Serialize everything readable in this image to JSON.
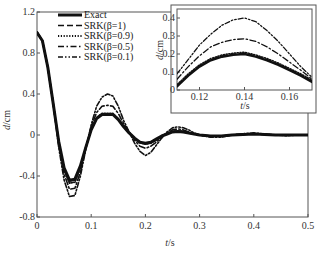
{
  "chart_data": [
    {
      "type": "line",
      "title": "",
      "xlabel": "t/s",
      "ylabel": "d/cm",
      "xlim": [
        0,
        0.5
      ],
      "ylim": [
        -0.8,
        1.2
      ],
      "xticks": [
        0,
        0.1,
        0.2,
        0.3,
        0.4,
        0.5
      ],
      "xtick_labels": [
        "0",
        "0.1",
        "0.2",
        "0.3",
        "0.4",
        "0.5"
      ],
      "yticks": [
        -0.8,
        -0.4,
        0,
        0.4,
        0.8,
        1.2
      ],
      "ytick_labels": [
        "-0.8",
        "-0.4",
        "0",
        "0.4",
        "0.8",
        "1.2"
      ],
      "grid": false,
      "legend_position": "upper left",
      "x": [
        0,
        0.01,
        0.02,
        0.03,
        0.04,
        0.05,
        0.06,
        0.07,
        0.08,
        0.09,
        0.1,
        0.11,
        0.12,
        0.13,
        0.14,
        0.15,
        0.16,
        0.17,
        0.18,
        0.19,
        0.2,
        0.21,
        0.22,
        0.23,
        0.24,
        0.25,
        0.26,
        0.27,
        0.28,
        0.29,
        0.3,
        0.32,
        0.34,
        0.36,
        0.38,
        0.4,
        0.42,
        0.44,
        0.46,
        0.48,
        0.5
      ],
      "series": [
        {
          "name": "Exact",
          "style": "solid-thick",
          "values": [
            1.0,
            0.92,
            0.66,
            0.3,
            -0.06,
            -0.32,
            -0.44,
            -0.43,
            -0.3,
            -0.12,
            0.05,
            0.16,
            0.2,
            0.2,
            0.2,
            0.15,
            0.08,
            0.02,
            -0.03,
            -0.07,
            -0.08,
            -0.07,
            -0.04,
            -0.01,
            0.01,
            0.03,
            0.035,
            0.03,
            0.02,
            0.01,
            0.0,
            -0.01,
            -0.01,
            0.0,
            0.005,
            0.01,
            0.005,
            0.0,
            0.0,
            0.0,
            0.0
          ]
        },
        {
          "name": "SRK(β=1)",
          "style": "dashed",
          "values": [
            1.0,
            0.92,
            0.66,
            0.3,
            -0.06,
            -0.33,
            -0.45,
            -0.44,
            -0.31,
            -0.12,
            0.05,
            0.16,
            0.205,
            0.205,
            0.205,
            0.155,
            0.08,
            0.02,
            -0.03,
            -0.07,
            -0.085,
            -0.075,
            -0.045,
            -0.01,
            0.01,
            0.03,
            0.035,
            0.03,
            0.02,
            0.01,
            0.0,
            -0.01,
            -0.01,
            0.0,
            0.005,
            0.01,
            0.005,
            0.0,
            0.0,
            0.0,
            0.0
          ]
        },
        {
          "name": "SRK(β=0.9)",
          "style": "dotted",
          "values": [
            1.0,
            0.92,
            0.66,
            0.3,
            -0.07,
            -0.34,
            -0.47,
            -0.46,
            -0.32,
            -0.12,
            0.06,
            0.17,
            0.21,
            0.21,
            0.21,
            0.16,
            0.085,
            0.02,
            -0.035,
            -0.075,
            -0.09,
            -0.08,
            -0.05,
            -0.01,
            0.015,
            0.035,
            0.04,
            0.035,
            0.02,
            0.01,
            0.0,
            -0.01,
            -0.012,
            0.0,
            0.006,
            0.012,
            0.006,
            0.0,
            0.0,
            0.0,
            0.0
          ]
        },
        {
          "name": "SRK(β=0.5)",
          "style": "dash-dot",
          "values": [
            1.0,
            0.92,
            0.66,
            0.3,
            -0.09,
            -0.38,
            -0.53,
            -0.52,
            -0.36,
            -0.13,
            0.08,
            0.22,
            0.28,
            0.29,
            0.28,
            0.21,
            0.11,
            0.03,
            -0.05,
            -0.11,
            -0.13,
            -0.11,
            -0.07,
            -0.02,
            0.02,
            0.05,
            0.06,
            0.05,
            0.03,
            0.01,
            0.0,
            -0.015,
            -0.015,
            0.0,
            0.01,
            0.015,
            0.008,
            0.0,
            -0.005,
            0.0,
            0.0
          ]
        },
        {
          "name": "SRK(β=0.1)",
          "style": "dash-dot-dot",
          "values": [
            1.0,
            0.92,
            0.66,
            0.3,
            -0.12,
            -0.44,
            -0.6,
            -0.59,
            -0.4,
            -0.14,
            0.1,
            0.28,
            0.37,
            0.4,
            0.38,
            0.28,
            0.14,
            0.03,
            -0.08,
            -0.16,
            -0.2,
            -0.17,
            -0.1,
            -0.03,
            0.03,
            0.07,
            0.08,
            0.07,
            0.05,
            0.02,
            0.0,
            -0.02,
            -0.02,
            0.0,
            0.012,
            0.02,
            0.01,
            0.0,
            -0.008,
            0.0,
            0.0
          ]
        }
      ]
    },
    {
      "type": "line",
      "title": "inset",
      "xlabel": "t/s",
      "ylabel": "d/cm",
      "xlim": [
        0.11,
        0.17
      ],
      "ylim": [
        0,
        0.45
      ],
      "xticks": [
        0.12,
        0.14,
        0.16
      ],
      "xtick_labels": [
        "0.12",
        "0.14",
        "0.16"
      ],
      "yticks": [
        0,
        0.1,
        0.2,
        0.3,
        0.4
      ],
      "ytick_labels": [
        "0",
        "0.1",
        "0.2",
        "0.3",
        "0.4"
      ],
      "grid": false,
      "x": [
        0.11,
        0.115,
        0.12,
        0.125,
        0.13,
        0.135,
        0.14,
        0.145,
        0.15,
        0.155,
        0.16,
        0.165,
        0.17
      ],
      "series": [
        {
          "name": "Exact",
          "style": "solid-thick",
          "values": [
            0.02,
            0.08,
            0.13,
            0.165,
            0.185,
            0.195,
            0.2,
            0.185,
            0.165,
            0.14,
            0.11,
            0.08,
            0.045
          ]
        },
        {
          "name": "SRK(β=1)",
          "style": "dashed",
          "values": [
            0.025,
            0.085,
            0.135,
            0.17,
            0.19,
            0.2,
            0.205,
            0.19,
            0.17,
            0.145,
            0.115,
            0.085,
            0.05
          ]
        },
        {
          "name": "SRK(β=0.9)",
          "style": "dotted",
          "values": [
            0.03,
            0.09,
            0.14,
            0.175,
            0.195,
            0.205,
            0.21,
            0.195,
            0.175,
            0.15,
            0.12,
            0.09,
            0.055
          ]
        },
        {
          "name": "SRK(β=0.5)",
          "style": "dash-dot",
          "values": [
            0.06,
            0.13,
            0.19,
            0.24,
            0.265,
            0.28,
            0.285,
            0.27,
            0.24,
            0.2,
            0.155,
            0.11,
            0.06
          ]
        },
        {
          "name": "SRK(β=0.1)",
          "style": "dash-dot-dot",
          "values": [
            0.09,
            0.17,
            0.25,
            0.31,
            0.36,
            0.39,
            0.4,
            0.38,
            0.33,
            0.27,
            0.2,
            0.13,
            0.07
          ]
        }
      ]
    }
  ],
  "labels": {
    "main_xlabel_t": "t",
    "main_xlabel_unit": "/s",
    "main_ylabel_d": "d",
    "main_ylabel_unit": "/cm",
    "inset_xlabel_t": "t",
    "inset_xlabel_unit": "/s",
    "inset_ylabel_d": "d",
    "inset_ylabel_unit": "/cm"
  },
  "legend": [
    {
      "label": "Exact",
      "style": "solid-thick"
    },
    {
      "label": "SRK(β=1)",
      "style": "dashed"
    },
    {
      "label": "SRK(β=0.9)",
      "style": "dotted"
    },
    {
      "label": "SRK(β=0.5)",
      "style": "dash-dot"
    },
    {
      "label": "SRK(β=0.1)",
      "style": "dash-dot-dot"
    }
  ],
  "colors": {
    "line": "#111111",
    "axis": "#555555",
    "background": "#ffffff"
  }
}
